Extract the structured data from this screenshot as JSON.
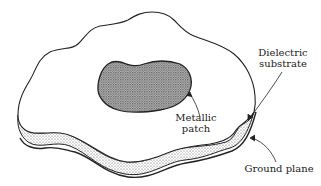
{
  "diagram": {
    "labels": {
      "dielectric_line1": "Dielectric",
      "dielectric_line2": "substrate",
      "patch_line1": "Metallic",
      "patch_line2": "patch",
      "ground": "Ground plane"
    },
    "components": [
      {
        "id": "metallic-patch",
        "label": "Metallic patch"
      },
      {
        "id": "dielectric-substrate",
        "label": "Dielectric substrate"
      },
      {
        "id": "ground-plane",
        "label": "Ground plane"
      }
    ],
    "colors": {
      "outline": "#222222",
      "substrate_fill": "#d9d9d9",
      "patch_fill": "#9a9a9a",
      "background": "#ffffff"
    }
  }
}
